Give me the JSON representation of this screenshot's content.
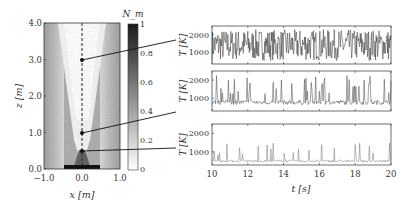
{
  "figure": {
    "left_panel": {
      "xlabel": "x [m]",
      "ylabel": "z [m]",
      "xticks": [
        "−1.0",
        "0.0",
        "1.0"
      ],
      "yticks": [
        "0.0",
        "1.0",
        "2.0",
        "3.0",
        "4.0"
      ],
      "probe_points_z": [
        0.5,
        1.0,
        3.0
      ],
      "colorbar": {
        "label": "N_m",
        "ticks": [
          "0",
          "0.2",
          "0.4",
          "0.6",
          "0.8",
          "1"
        ]
      }
    },
    "right_panels": {
      "xlabel": "t [s]",
      "xticks": [
        "10",
        "12",
        "14",
        "16",
        "18",
        "20"
      ],
      "ylabel": "T [K]",
      "yticks": [
        "1000",
        "2000"
      ]
    }
  },
  "chart_data": [
    {
      "type": "heatmap",
      "title": "",
      "xlabel": "x [m]",
      "ylabel": "z [m]",
      "xlim": [
        -1.0,
        1.0
      ],
      "ylim": [
        0.0,
        4.0
      ],
      "xticks": [
        -1.0,
        0.0,
        1.0
      ],
      "yticks": [
        0.0,
        1.0,
        2.0,
        3.0,
        4.0
      ],
      "colorbar": {
        "label": "N_m",
        "range": [
          0,
          1
        ],
        "ticks": [
          0,
          0.2,
          0.4,
          0.6,
          0.8,
          1
        ]
      },
      "annotations": [
        "dashed centerline at x=0",
        "probe points at z=0.5, 1.0, 3.0 on x=0"
      ]
    },
    {
      "type": "line",
      "probe_z": 3.0,
      "xlabel": "t [s]",
      "ylabel": "T [K]",
      "xlim": [
        10,
        20
      ],
      "ylim": [
        300,
        2500
      ],
      "yticks": [
        1000,
        2000
      ],
      "description": "highly fluctuating temperature between ~400 and ~2300 K"
    },
    {
      "type": "line",
      "probe_z": 1.0,
      "xlabel": "t [s]",
      "ylabel": "T [K]",
      "xlim": [
        10,
        20
      ],
      "ylim": [
        300,
        2500
      ],
      "yticks": [
        1000,
        2000
      ],
      "description": "intermittent peaks up to ~2300 K, baseline ~700 K"
    },
    {
      "type": "line",
      "probe_z": 0.5,
      "xlabel": "t [s]",
      "ylabel": "T [K]",
      "xlim": [
        10,
        20
      ],
      "xticks": [
        10,
        12,
        14,
        16,
        18,
        20
      ],
      "ylim": [
        300,
        2500
      ],
      "yticks": [
        1000,
        2000
      ],
      "description": "mostly low ~500 K with occasional peaks up to ~1500 K"
    }
  ]
}
